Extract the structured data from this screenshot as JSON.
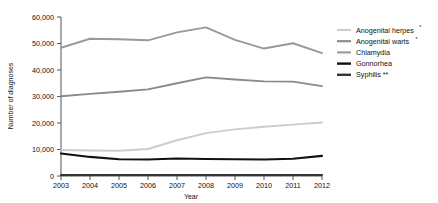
{
  "chart_data": {
    "type": "line",
    "title": "",
    "xlabel": "Year",
    "ylabel": "Number of diagnoses",
    "grid": false,
    "legend_position": "right",
    "x": [
      2003,
      2004,
      2005,
      2006,
      2007,
      2008,
      2009,
      2010,
      2011,
      2012
    ],
    "xlim": [
      2003,
      2012
    ],
    "ylim": [
      0,
      60000
    ],
    "yticks": [
      0,
      10000,
      20000,
      30000,
      40000,
      50000,
      60000
    ],
    "ytick_labels": [
      "0",
      "10,000",
      "20,000",
      "30,000",
      "40,000",
      "50,000",
      "60,000"
    ],
    "xtick_labels": [
      "2003",
      "2004",
      "2005",
      "2006",
      "2007",
      "2008",
      "2009",
      "2010",
      "2011",
      "2012"
    ],
    "series": [
      {
        "name": "Anogenital herpes*",
        "color": "#cccccc",
        "values": [
          9800,
          9600,
          9500,
          10200,
          13500,
          16200,
          17600,
          18600,
          19400,
          20200
        ]
      },
      {
        "name": "Anogenital warts*",
        "color": "#8a8a8a",
        "values": [
          30100,
          31000,
          31800,
          32700,
          35000,
          37200,
          36400,
          35700,
          35600,
          33900
        ]
      },
      {
        "name": "Chlamydia",
        "color": "#999999",
        "values": [
          48400,
          51800,
          51600,
          51200,
          54200,
          56100,
          51400,
          48100,
          50100,
          46400
        ]
      },
      {
        "name": "Gonnorhea",
        "color": "#111111",
        "values": [
          8500,
          7200,
          6300,
          6200,
          6600,
          6400,
          6300,
          6200,
          6500,
          7600
        ]
      },
      {
        "name": "Syphilis **",
        "color": "#333333",
        "values": [
          400,
          400,
          400,
          400,
          400,
          400,
          400,
          400,
          400,
          400
        ]
      }
    ]
  },
  "legend": {
    "items": [
      {
        "label": "Anogenital herpes",
        "marker": "*",
        "swatch": "#cccccc"
      },
      {
        "label": "Anogenital warts",
        "marker": "*",
        "swatch": "#8a8a8a"
      },
      {
        "label": "Chlamydia",
        "marker": "",
        "swatch": "#999999"
      },
      {
        "label": "Gonnorhea",
        "marker": "",
        "swatch": "#111111"
      },
      {
        "label": "Syphilis **",
        "marker": "",
        "swatch": "#333333"
      }
    ]
  },
  "axes": {
    "y_title": "Number of diagnoses",
    "x_title": "Year"
  }
}
